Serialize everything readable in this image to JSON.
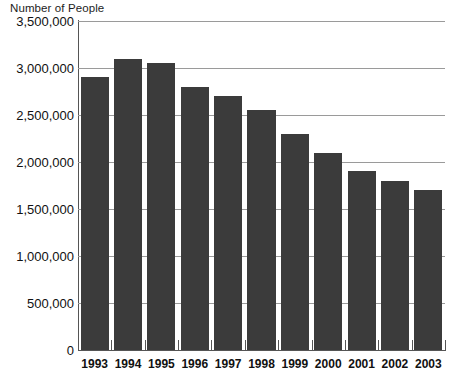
{
  "chart_data": {
    "type": "bar",
    "title": "Number of People",
    "xlabel": "",
    "ylabel": "Number of People",
    "categories": [
      "1993",
      "1994",
      "1995",
      "1996",
      "1997",
      "1998",
      "1999",
      "2000",
      "2001",
      "2002",
      "2003"
    ],
    "values": [
      2900000,
      3100000,
      3050000,
      2800000,
      2700000,
      2550000,
      2300000,
      2100000,
      1900000,
      1800000,
      1700000
    ],
    "ylim": [
      0,
      3500000
    ],
    "ytick_values": [
      0,
      500000,
      1000000,
      1500000,
      2000000,
      2500000,
      3000000,
      3500000
    ],
    "ytick_labels": [
      "0",
      "500,000",
      "1,000,000",
      "1,500,000",
      "2,000,000",
      "2,500,000",
      "3,000,000",
      "3,500,000"
    ],
    "grid": true,
    "legend": null,
    "bar_color": "#3b3b3b",
    "grid_color": "#9a9a9a",
    "axis_color": "#555555",
    "background": "#ffffff"
  }
}
